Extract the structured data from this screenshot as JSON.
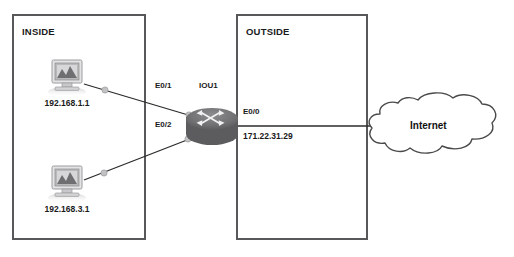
{
  "diagram": {
    "zones": [
      {
        "name": "inside",
        "label": "INSIDE"
      },
      {
        "name": "outside",
        "label": "OUTSIDE"
      }
    ],
    "hosts": [
      {
        "name": "pc-top",
        "ip": "192.168.1.1",
        "icon": "computer-icon"
      },
      {
        "name": "pc-bottom",
        "ip": "192.168.3.1",
        "icon": "computer-icon"
      }
    ],
    "router": {
      "name": "IOU1",
      "icon": "router-icon",
      "interfaces": [
        {
          "name": "E0/1",
          "label": "E0/1",
          "address": ""
        },
        {
          "name": "E0/2",
          "label": "E0/2",
          "address": ""
        },
        {
          "name": "E0/0",
          "label": "E0/0",
          "address": "171.22.31.29"
        }
      ]
    },
    "cloud": {
      "label": "Internet",
      "icon": "cloud-icon"
    },
    "colors": {
      "box_border": "#58585a",
      "link": "#2b2b2b",
      "router_body": "#6e6e70",
      "node_dot": "#b9b9bb",
      "cloud_border": "#4a4a4c",
      "text": "#1a1a1a"
    }
  }
}
